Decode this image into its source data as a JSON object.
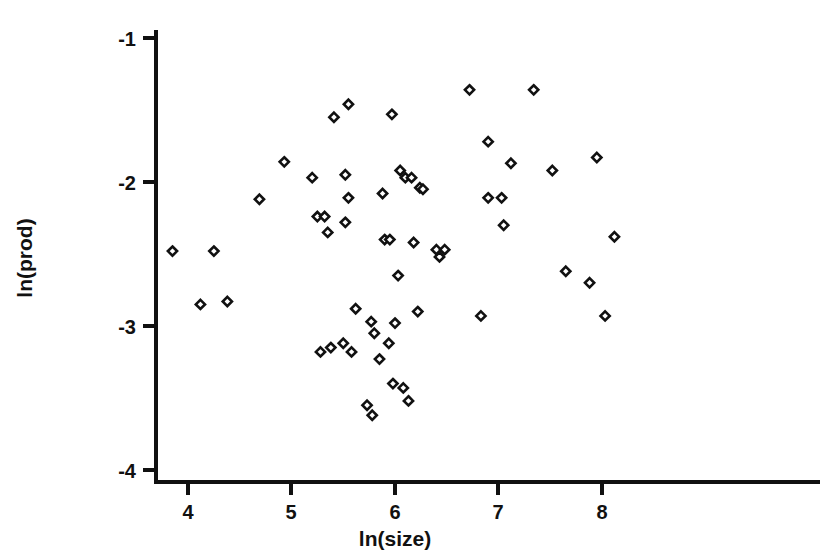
{
  "chart_data": {
    "type": "scatter",
    "title": "",
    "xlabel": "ln(size)",
    "ylabel": "ln(prod)",
    "xlim": [
      3.69,
      8.42
    ],
    "ylim": [
      -4.08,
      -0.94
    ],
    "xticks": [
      4,
      5,
      6,
      7,
      8
    ],
    "yticks": [
      -1,
      -2,
      -3,
      -4
    ],
    "xticklabels": [
      "4",
      "5",
      "6",
      "7",
      "8"
    ],
    "yticklabels": [
      "-1",
      "-2",
      "-3",
      "-4"
    ],
    "grid": false,
    "legend": null,
    "marker": "diamond",
    "marker_color": "#111111",
    "marker_fill": "#ffffff",
    "points": [
      [
        3.85,
        -2.48
      ],
      [
        4.25,
        -2.48
      ],
      [
        4.12,
        -2.85
      ],
      [
        4.38,
        -2.83
      ],
      [
        4.69,
        -2.12
      ],
      [
        4.93,
        -1.86
      ],
      [
        5.28,
        -3.18
      ],
      [
        5.25,
        -2.24
      ],
      [
        5.32,
        -2.24
      ],
      [
        5.2,
        -1.97
      ],
      [
        5.41,
        -1.55
      ],
      [
        5.55,
        -1.46
      ],
      [
        5.52,
        -1.95
      ],
      [
        5.55,
        -2.11
      ],
      [
        5.52,
        -2.28
      ],
      [
        5.35,
        -2.35
      ],
      [
        5.38,
        -3.15
      ],
      [
        5.5,
        -3.12
      ],
      [
        5.58,
        -3.18
      ],
      [
        5.73,
        -3.55
      ],
      [
        5.62,
        -2.88
      ],
      [
        5.77,
        -2.97
      ],
      [
        5.8,
        -3.05
      ],
      [
        5.85,
        -3.23
      ],
      [
        5.94,
        -3.12
      ],
      [
        5.98,
        -3.4
      ],
      [
        5.78,
        -3.62
      ],
      [
        5.88,
        -2.08
      ],
      [
        5.97,
        -1.53
      ],
      [
        5.9,
        -2.4
      ],
      [
        5.95,
        -2.4
      ],
      [
        6.05,
        -1.92
      ],
      [
        6.1,
        -1.97
      ],
      [
        6.16,
        -1.97
      ],
      [
        6.24,
        -2.04
      ],
      [
        6.27,
        -2.05
      ],
      [
        6.03,
        -2.65
      ],
      [
        6.08,
        -3.43
      ],
      [
        6.13,
        -3.52
      ],
      [
        6.0,
        -2.98
      ],
      [
        6.22,
        -2.9
      ],
      [
        6.18,
        -2.42
      ],
      [
        6.4,
        -2.47
      ],
      [
        6.48,
        -2.47
      ],
      [
        6.43,
        -2.52
      ],
      [
        6.72,
        -1.36
      ],
      [
        6.9,
        -1.72
      ],
      [
        6.83,
        -2.93
      ],
      [
        6.9,
        -2.11
      ],
      [
        7.03,
        -2.11
      ],
      [
        7.05,
        -2.3
      ],
      [
        7.34,
        -1.36
      ],
      [
        7.12,
        -1.87
      ],
      [
        7.52,
        -1.92
      ],
      [
        7.65,
        -2.62
      ],
      [
        7.88,
        -2.7
      ],
      [
        7.95,
        -1.83
      ],
      [
        8.12,
        -2.38
      ],
      [
        8.03,
        -2.93
      ]
    ]
  },
  "axis_labels": {
    "y_axis_title": "ln(prod)",
    "x_axis_title": "ln(size)"
  }
}
